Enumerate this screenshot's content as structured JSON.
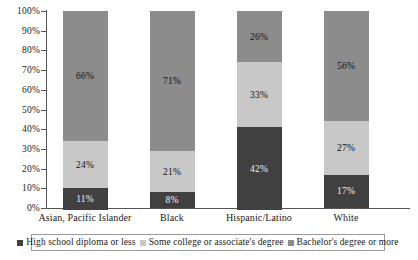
{
  "chart_data": {
    "type": "bar",
    "subtype": "stacked-100-percent",
    "title": "",
    "xlabel": "",
    "ylabel": "",
    "ylim": [
      0,
      100
    ],
    "ytick_labels": [
      "100%",
      "90%",
      "80%",
      "70%",
      "60%",
      "50%",
      "40%",
      "30%",
      "20%",
      "10%",
      "0%"
    ],
    "ytick_values": [
      100,
      90,
      80,
      70,
      60,
      50,
      40,
      30,
      20,
      10,
      0
    ],
    "grid": false,
    "legend_position": "bottom",
    "categories": [
      "Asian, Pacific Islander",
      "Black",
      "Hispanic/Latino",
      "White"
    ],
    "series": [
      {
        "name": "High school diploma or less",
        "color": "#404040",
        "values": [
          11,
          8,
          42,
          17
        ],
        "labels": [
          "11%",
          "8%",
          "42%",
          "17%"
        ]
      },
      {
        "name": "Some college or associate's degree",
        "color": "#c8c8c8",
        "values": [
          24,
          21,
          33,
          27
        ],
        "labels": [
          "24%",
          "21%",
          "33%",
          "27%"
        ]
      },
      {
        "name": "Bachelor's degree or more",
        "color": "#8c8c8c",
        "values": [
          66,
          71,
          26,
          56
        ],
        "labels": [
          "66%",
          "71%",
          "26%",
          "56%"
        ]
      }
    ]
  },
  "axis": {
    "y": {
      "ticks": [
        {
          "label": "100%",
          "value": 100
        },
        {
          "label": "90%",
          "value": 90
        },
        {
          "label": "80%",
          "value": 80
        },
        {
          "label": "70%",
          "value": 70
        },
        {
          "label": "60%",
          "value": 60
        },
        {
          "label": "50%",
          "value": 50
        },
        {
          "label": "40%",
          "value": 40
        },
        {
          "label": "30%",
          "value": 30
        },
        {
          "label": "20%",
          "value": 20
        },
        {
          "label": "10%",
          "value": 10
        },
        {
          "label": "0%",
          "value": 0
        }
      ]
    },
    "x": {
      "categories": [
        {
          "label": "Asian, Pacific Islander"
        },
        {
          "label": "Black"
        },
        {
          "label": "Hispanic/Latino"
        },
        {
          "label": "White"
        }
      ]
    }
  },
  "legend": {
    "items": [
      {
        "label": "High school diploma or less",
        "color": "#404040"
      },
      {
        "label": "Some college or associate's degree",
        "color": "#c8c8c8"
      },
      {
        "label": "Bachelor's degree or more",
        "color": "#8c8c8c"
      }
    ]
  }
}
